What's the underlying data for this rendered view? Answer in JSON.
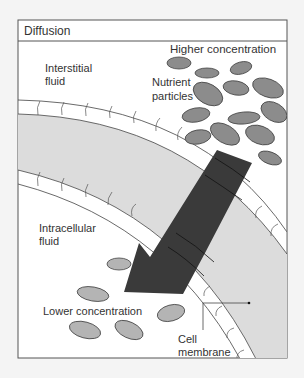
{
  "figure": {
    "title": "Diffusion",
    "labels": {
      "higher_concentration": "Higher concentration",
      "interstitial_fluid_line1": "Interstitial",
      "interstitial_fluid_line2": "fluid",
      "nutrient_particles_line1": "Nutrient",
      "nutrient_particles_line2": "particles",
      "intracellular_fluid_line1": "Intracellular",
      "intracellular_fluid_line2": "fluid",
      "lower_concentration": "Lower concentration",
      "cell_membrane_line1": "Cell",
      "cell_membrane_line2": "membrane"
    },
    "colors": {
      "background": "#ffffff",
      "frame": "#555555",
      "membrane_band": "#dcdcdc",
      "particle_high": "#8c8c8c",
      "particle_low": "#b4b4b4",
      "arrow": "#3a3a3a"
    }
  }
}
